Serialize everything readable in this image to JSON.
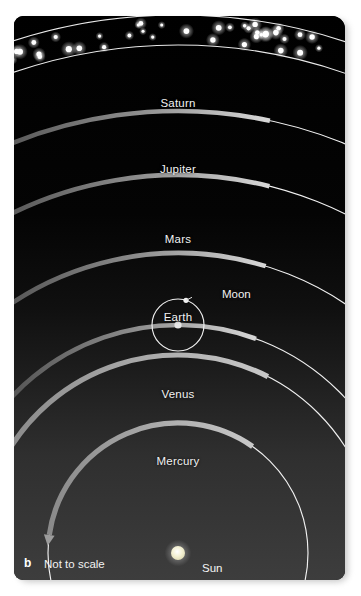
{
  "figure": {
    "panel_letter": "b",
    "scale_note": "Not to scale",
    "caption_hidden": "",
    "background_top_color": "#000000",
    "background_bottom_color": "#3a3a3a",
    "orbit_line_color": "#f0f0f0",
    "arrow_color": "#9a9a9a",
    "label_color": "#f2f2f2",
    "star_color": "#ffffff"
  },
  "center_body": {
    "name": "Sun",
    "color": "#f2efcf",
    "cx": 178,
    "cy": 553,
    "r": 7
  },
  "star_band": {
    "name": "fixed-stars-band",
    "inner_radius": 508,
    "outer_radius": 538,
    "star_count": 46
  },
  "chart_data": {
    "type": "diagram",
    "subtitle": "Not to scale",
    "center": "Sun",
    "orbit_direction": "counterclockwise (arrows point left along each orbit)",
    "orbits": [
      {
        "name": "Mercury",
        "order": 1,
        "radius": 130,
        "label_x": 178,
        "label_y": 455,
        "arrow_start_deg": 55,
        "arrow_end_deg": 172
      },
      {
        "name": "Venus",
        "order": 2,
        "radius": 198,
        "label_x": 178,
        "label_y": 388,
        "arrow_start_deg": 63,
        "arrow_end_deg": 152
      },
      {
        "name": "Earth",
        "order": 3,
        "radius": 228,
        "label_x": 178,
        "label_y": 311,
        "arrow_start_deg": 70,
        "arrow_end_deg": 148
      },
      {
        "name": "Mars",
        "order": 4,
        "radius": 300,
        "label_x": 178,
        "label_y": 233,
        "arrow_start_deg": 73,
        "arrow_end_deg": 132
      },
      {
        "name": "Jupiter",
        "order": 5,
        "radius": 378,
        "label_x": 178,
        "label_y": 163,
        "arrow_start_deg": 76,
        "arrow_end_deg": 123
      },
      {
        "name": "Saturn",
        "order": 6,
        "radius": 442,
        "label_x": 178,
        "label_y": 97,
        "arrow_start_deg": 78,
        "arrow_end_deg": 118
      }
    ],
    "satellite": {
      "name": "Moon",
      "parent": "Earth",
      "orbit_radius": 26,
      "label_x": 222,
      "label_y": 288,
      "moon_angle_deg": 72
    },
    "labels": [
      "Saturn",
      "Jupiter",
      "Mars",
      "Moon",
      "Earth",
      "Venus",
      "Mercury",
      "Sun",
      "Not to scale",
      "b"
    ]
  }
}
